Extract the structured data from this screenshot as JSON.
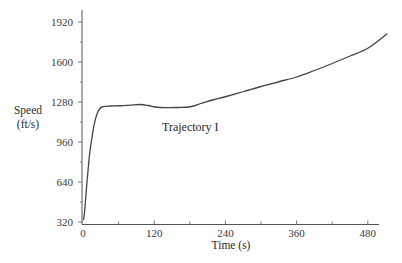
{
  "chart_data": {
    "type": "line",
    "title": "",
    "xlabel": "Time (s)",
    "ylabel": "Speed\n(ft/s)",
    "ylabel_lines": [
      "Speed",
      "(ft/s)"
    ],
    "xlim": [
      0,
      520
    ],
    "ylim": [
      320,
      1980
    ],
    "xticks": [
      0,
      120,
      240,
      360,
      480
    ],
    "xtick_labels": [
      "0",
      "120",
      "240",
      "360",
      "480"
    ],
    "x_minor_ticks": [
      60,
      180,
      300,
      420
    ],
    "yticks": [
      320,
      640,
      960,
      1280,
      1600,
      1920
    ],
    "ytick_labels": [
      "320",
      "640",
      "960",
      "1280",
      "1600",
      "1920"
    ],
    "y_minor_ticks": [
      480,
      800,
      1120,
      1440,
      1760
    ],
    "grid": false,
    "legend": null,
    "annotations": [
      {
        "text": "Trajectory I",
        "x": 135,
        "y": 1100
      }
    ],
    "series": [
      {
        "name": "Trajectory I",
        "color": "#444444",
        "x": [
          1,
          3,
          6,
          9,
          12,
          15,
          18,
          22,
          26,
          30,
          36,
          45,
          63,
          80,
          96,
          110,
          125,
          140,
          160,
          181,
          200,
          220,
          240,
          270,
          300,
          330,
          360,
          390,
          420,
          450,
          480,
          512
        ],
        "y": [
          340,
          420,
          600,
          760,
          900,
          990,
          1080,
          1160,
          1210,
          1235,
          1245,
          1248,
          1250,
          1255,
          1260,
          1252,
          1238,
          1235,
          1236,
          1242,
          1270,
          1298,
          1322,
          1362,
          1404,
          1442,
          1480,
          1532,
          1588,
          1648,
          1710,
          1824
        ]
      }
    ]
  }
}
